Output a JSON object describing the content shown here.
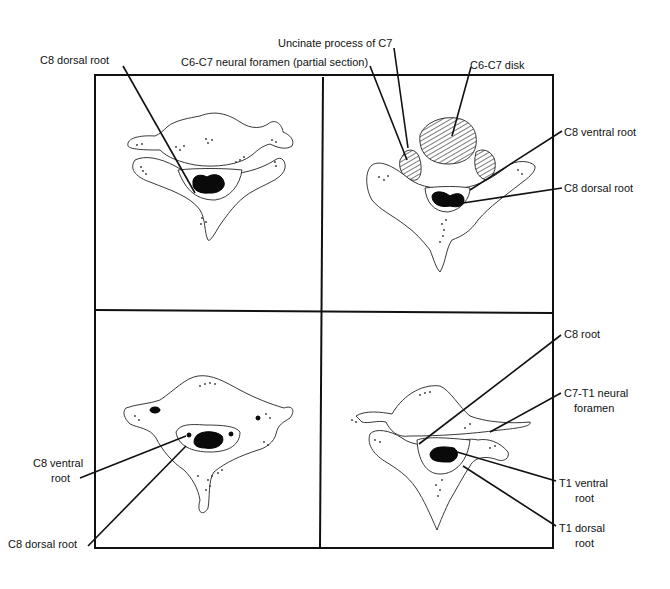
{
  "figure": {
    "panels": [
      {
        "id": "top-left",
        "labels": [
          {
            "text": "C8 dorsal root"
          }
        ]
      },
      {
        "id": "top-right",
        "labels": [
          {
            "text": "Uncinate process of C7"
          },
          {
            "text": "C6-C7 neural foramen (partial section)"
          },
          {
            "text": "C6-C7 disk"
          },
          {
            "text": "C8 ventral root"
          },
          {
            "text": "C8 dorsal root"
          }
        ]
      },
      {
        "id": "bottom-left",
        "labels": [
          {
            "text": "C8 ventral",
            "text2": "root"
          },
          {
            "text": "C8 dorsal root"
          }
        ]
      },
      {
        "id": "bottom-right",
        "labels": [
          {
            "text": "C8 root"
          },
          {
            "text": "C7-T1 neural",
            "text2": "foramen"
          },
          {
            "text": "T1 ventral",
            "text2": "root"
          },
          {
            "text": "T1 dorsal",
            "text2": "root"
          }
        ]
      }
    ]
  }
}
